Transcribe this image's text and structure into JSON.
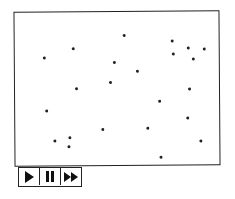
{
  "canvas": {
    "dots": [
      [
        123,
        34
      ],
      [
        72,
        47
      ],
      [
        43,
        56
      ],
      [
        171,
        40
      ],
      [
        187,
        47
      ],
      [
        172,
        53
      ],
      [
        203,
        48
      ],
      [
        192,
        58
      ],
      [
        113,
        61
      ],
      [
        136,
        70
      ],
      [
        109,
        81
      ],
      [
        75,
        87
      ],
      [
        188,
        88
      ],
      [
        158,
        100
      ],
      [
        45,
        109
      ],
      [
        186,
        117
      ],
      [
        101,
        128
      ],
      [
        146,
        127
      ],
      [
        53,
        139
      ],
      [
        68,
        136
      ],
      [
        67,
        145
      ],
      [
        199,
        140
      ],
      [
        159,
        156
      ]
    ]
  },
  "controls": {
    "buttons": [
      {
        "icon": "play-icon"
      },
      {
        "icon": "pause-icon"
      },
      {
        "icon": "fast-forward-icon"
      }
    ]
  }
}
